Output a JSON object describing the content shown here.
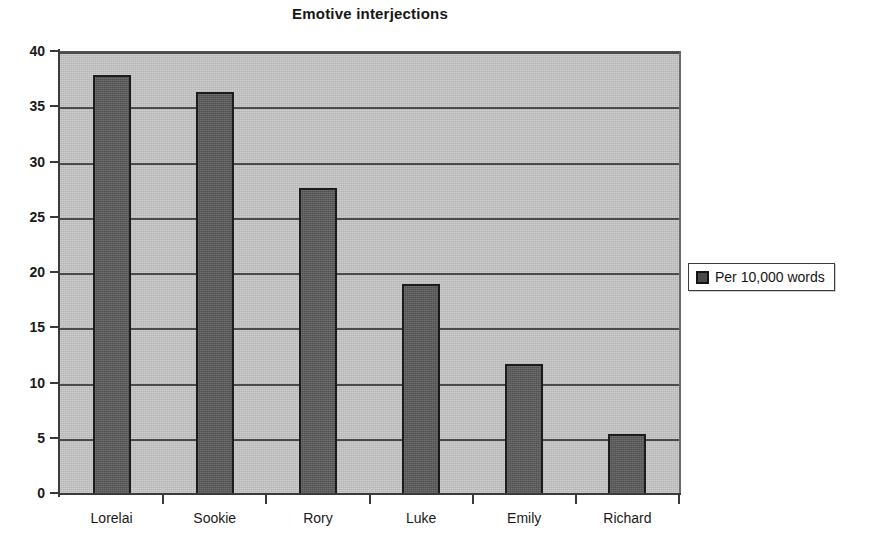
{
  "chart_data": {
    "type": "bar",
    "title": "Emotive interjections",
    "xlabel": "",
    "ylabel": "",
    "categories": [
      "Lorelai",
      "Sookie",
      "Rory",
      "Luke",
      "Emily",
      "Richard"
    ],
    "series": [
      {
        "name": "Per 10,000 words",
        "values": [
          38.0,
          36.5,
          27.8,
          19.1,
          11.9,
          5.5
        ]
      }
    ],
    "values": [
      38.0,
      36.5,
      27.8,
      19.1,
      11.9,
      5.5
    ],
    "ylim": [
      0,
      40
    ],
    "ytick_step": 5,
    "ytick_labels": [
      "40",
      "35",
      "30",
      "25",
      "20",
      "15",
      "10",
      "5",
      "0"
    ],
    "grid": true,
    "legend_position": "right",
    "colors": {
      "bar_fill": "#5b5b5b",
      "bar_outline": "#1c1c1c",
      "plot_background": "#c4c4c4",
      "gridline": "#4a4a4a",
      "axis": "#3a3a3a",
      "text": "#1a1a1a",
      "page_background": "#ffffff"
    }
  },
  "legend": {
    "entries": [
      {
        "label": "Per 10,000 words",
        "swatch": "legend-swatch-icon"
      }
    ]
  }
}
